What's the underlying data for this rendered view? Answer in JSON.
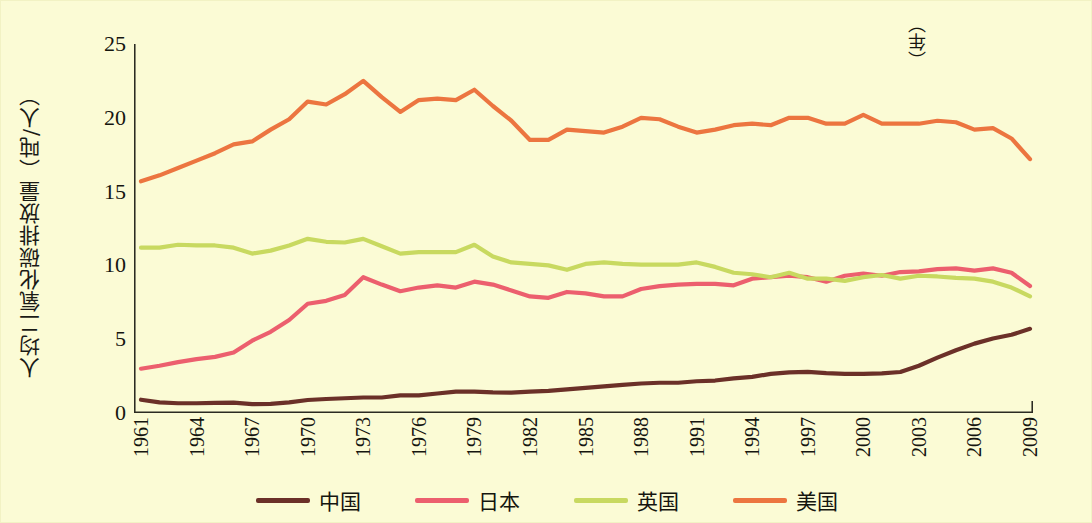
{
  "chart_data": {
    "type": "line",
    "title": "",
    "xlabel": "（年）",
    "ylabel": "人均二氧化碳排放量（吨/人）",
    "xlim": [
      1961,
      2009
    ],
    "ylim": [
      0,
      25
    ],
    "ytick_labels": [
      "0",
      "5",
      "10",
      "15",
      "20",
      "25"
    ],
    "ytick_values": [
      0,
      5,
      10,
      15,
      20,
      25
    ],
    "xtick_labels": [
      "1961",
      "1964",
      "1967",
      "1970",
      "1973",
      "1976",
      "1979",
      "1982",
      "1985",
      "1988",
      "1991",
      "1994",
      "1997",
      "2000",
      "2003",
      "2006",
      "2009"
    ],
    "xtick_values": [
      1961,
      1964,
      1967,
      1970,
      1973,
      1976,
      1979,
      1982,
      1985,
      1988,
      1991,
      1994,
      1997,
      2000,
      2003,
      2006,
      2009
    ],
    "minor_tick_step": 1,
    "grid": false,
    "legend_position": "bottom",
    "x": [
      1961,
      1962,
      1963,
      1964,
      1965,
      1966,
      1967,
      1968,
      1969,
      1970,
      1971,
      1972,
      1973,
      1974,
      1975,
      1976,
      1977,
      1978,
      1979,
      1980,
      1981,
      1982,
      1983,
      1984,
      1985,
      1986,
      1987,
      1988,
      1989,
      1990,
      1991,
      1992,
      1993,
      1994,
      1995,
      1996,
      1997,
      1998,
      1999,
      2000,
      2001,
      2002,
      2003,
      2004,
      2005,
      2006,
      2007,
      2008,
      2009
    ],
    "series": [
      {
        "name": "中国",
        "color": "#6b3028",
        "values": [
          0.9,
          0.72,
          0.66,
          0.66,
          0.68,
          0.7,
          0.6,
          0.62,
          0.72,
          0.88,
          0.95,
          1.0,
          1.05,
          1.05,
          1.2,
          1.2,
          1.32,
          1.45,
          1.45,
          1.4,
          1.38,
          1.45,
          1.5,
          1.6,
          1.7,
          1.8,
          1.9,
          2.0,
          2.05,
          2.05,
          2.15,
          2.2,
          2.35,
          2.45,
          2.65,
          2.75,
          2.78,
          2.7,
          2.65,
          2.65,
          2.68,
          2.78,
          3.2,
          3.75,
          4.25,
          4.7,
          5.05,
          5.3,
          5.7
        ]
      },
      {
        "name": "日本",
        "color": "#ec5f6e",
        "values": [
          3.0,
          3.2,
          3.45,
          3.65,
          3.8,
          4.1,
          4.9,
          5.5,
          6.3,
          7.4,
          7.6,
          8.0,
          9.2,
          8.7,
          8.25,
          8.5,
          8.65,
          8.5,
          8.9,
          8.7,
          8.3,
          7.9,
          7.8,
          8.2,
          8.1,
          7.9,
          7.9,
          8.4,
          8.6,
          8.7,
          8.75,
          8.75,
          8.65,
          9.1,
          9.2,
          9.3,
          9.2,
          8.9,
          9.3,
          9.45,
          9.3,
          9.55,
          9.6,
          9.75,
          9.8,
          9.65,
          9.8,
          9.5,
          8.6
        ]
      },
      {
        "name": "英国",
        "color": "#c8d960",
        "values": [
          11.2,
          11.2,
          11.4,
          11.35,
          11.35,
          11.2,
          10.8,
          11.0,
          11.35,
          11.8,
          11.6,
          11.55,
          11.8,
          11.3,
          10.8,
          10.9,
          10.9,
          10.9,
          11.4,
          10.6,
          10.2,
          10.1,
          10.0,
          9.7,
          10.1,
          10.2,
          10.1,
          10.05,
          10.05,
          10.05,
          10.2,
          9.9,
          9.5,
          9.4,
          9.2,
          9.5,
          9.1,
          9.1,
          8.95,
          9.2,
          9.35,
          9.1,
          9.3,
          9.25,
          9.15,
          9.1,
          8.9,
          8.5,
          7.9
        ]
      },
      {
        "name": "美国",
        "color": "#ec7540",
        "values": [
          15.7,
          16.1,
          16.6,
          17.1,
          17.6,
          18.2,
          18.4,
          19.2,
          19.9,
          21.1,
          20.9,
          21.6,
          22.5,
          21.4,
          20.4,
          21.2,
          21.3,
          21.2,
          21.9,
          20.8,
          19.8,
          18.5,
          18.5,
          19.2,
          19.1,
          19.0,
          19.4,
          20.0,
          19.9,
          19.4,
          19.0,
          19.2,
          19.5,
          19.6,
          19.5,
          20.0,
          20.0,
          19.6,
          19.6,
          20.2,
          19.6,
          19.6,
          19.6,
          19.8,
          19.7,
          19.2,
          19.3,
          18.6,
          17.2
        ]
      }
    ]
  },
  "legend": {
    "items": [
      {
        "label": "中国",
        "color": "#6b3028"
      },
      {
        "label": "日本",
        "color": "#ec5f6e"
      },
      {
        "label": "英国",
        "color": "#c8d960"
      },
      {
        "label": "美国",
        "color": "#ec7540"
      }
    ]
  },
  "axis": {
    "y_title": "人均二氧化碳排放量（吨/人）",
    "x_unit": "（年）"
  }
}
